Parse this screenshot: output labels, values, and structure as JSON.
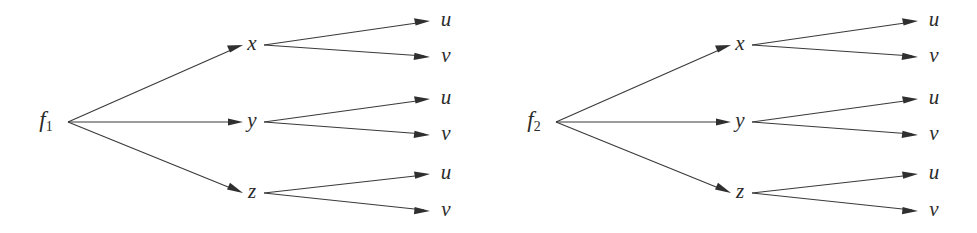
{
  "figure": {
    "kind": "tree-diagram-pair",
    "background_color": "#ffffff",
    "stroke_color": "#3a3a3a",
    "label_color": "#2b2b2b",
    "diagrams": [
      {
        "id": "left",
        "root": {
          "label": "f",
          "subscript": "1"
        },
        "mid_nodes": [
          {
            "label": "x",
            "leaves": [
              {
                "label": "u"
              },
              {
                "label": "v"
              }
            ]
          },
          {
            "label": "y",
            "leaves": [
              {
                "label": "u"
              },
              {
                "label": "v"
              }
            ]
          },
          {
            "label": "z",
            "leaves": [
              {
                "label": "u"
              },
              {
                "label": "v"
              }
            ]
          }
        ]
      },
      {
        "id": "right",
        "root": {
          "label": "f",
          "subscript": "2"
        },
        "mid_nodes": [
          {
            "label": "x",
            "leaves": [
              {
                "label": "u"
              },
              {
                "label": "v"
              }
            ]
          },
          {
            "label": "y",
            "leaves": [
              {
                "label": "u"
              },
              {
                "label": "v"
              }
            ]
          },
          {
            "label": "z",
            "leaves": [
              {
                "label": "u"
              },
              {
                "label": "v"
              }
            ]
          }
        ]
      }
    ]
  }
}
